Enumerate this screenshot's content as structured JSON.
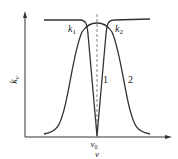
{
  "diagram": {
    "y_axis_label": "k",
    "y_axis_subscript": "ν",
    "x_axis_label": "ν",
    "center_label": "ν",
    "center_subscript": "0",
    "curve_labels": {
      "k1": "k",
      "k1_sub": "1",
      "k2": "k",
      "k2_sub": "2",
      "curve1": "1",
      "curve2": "2"
    },
    "colors": {
      "line": "#333333",
      "dashed": "#666666"
    }
  }
}
